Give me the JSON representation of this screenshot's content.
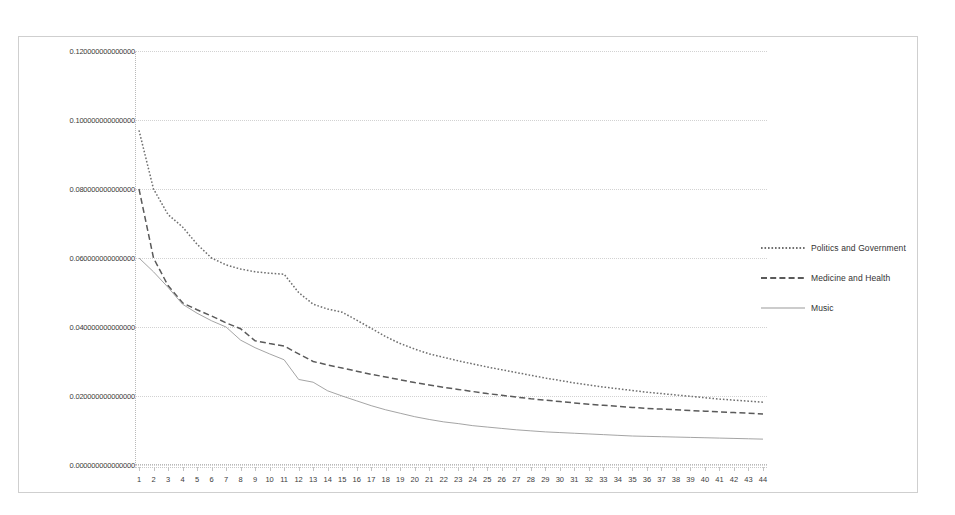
{
  "chart_data": {
    "type": "line",
    "title": "",
    "xlabel": "",
    "ylabel": "",
    "grid": true,
    "legend_position": "right",
    "xlim": [
      1,
      44
    ],
    "ylim": [
      0.0,
      0.12
    ],
    "ytick_labels": [
      "0.120000000000000",
      "0.100000000000000",
      "0.080000000000000",
      "0.060000000000000",
      "0.040000000000000",
      "0.020000000000000",
      "0.000000000000000"
    ],
    "ytick_values": [
      0.12,
      0.1,
      0.08,
      0.06,
      0.04,
      0.02,
      0.0
    ],
    "x": [
      1,
      2,
      3,
      4,
      5,
      6,
      7,
      8,
      9,
      10,
      11,
      12,
      13,
      14,
      15,
      16,
      17,
      18,
      19,
      20,
      21,
      22,
      23,
      24,
      25,
      26,
      27,
      28,
      29,
      30,
      31,
      32,
      33,
      34,
      35,
      36,
      37,
      38,
      39,
      40,
      41,
      42,
      43,
      44
    ],
    "xtick_labels": [
      "1",
      "2",
      "3",
      "4",
      "5",
      "6",
      "7",
      "8",
      "9",
      "10",
      "11",
      "12",
      "13",
      "14",
      "15",
      "16",
      "17",
      "18",
      "19",
      "20",
      "21",
      "22",
      "23",
      "24",
      "25",
      "26",
      "27",
      "28",
      "29",
      "30",
      "31",
      "32",
      "33",
      "34",
      "35",
      "36",
      "37",
      "38",
      "39",
      "40",
      "41",
      "42",
      "43",
      "44"
    ],
    "series": [
      {
        "name": "Politics and Government",
        "style": "dotted",
        "color": "#6f6f6f",
        "values": [
          0.097,
          0.08,
          0.0726,
          0.069,
          0.064,
          0.06,
          0.058,
          0.0568,
          0.056,
          0.0556,
          0.0553,
          0.05,
          0.0466,
          0.0452,
          0.0443,
          0.042,
          0.0396,
          0.0372,
          0.0352,
          0.0336,
          0.0322,
          0.0312,
          0.0302,
          0.0293,
          0.0284,
          0.0276,
          0.0268,
          0.026,
          0.0252,
          0.0245,
          0.0238,
          0.0232,
          0.0226,
          0.0221,
          0.0216,
          0.0211,
          0.0207,
          0.0203,
          0.0199,
          0.0195,
          0.0191,
          0.0188,
          0.0185,
          0.0182
        ]
      },
      {
        "name": "Medicine and Health",
        "style": "dashed",
        "color": "#5a5a5a",
        "values": [
          0.08,
          0.06,
          0.052,
          0.047,
          0.045,
          0.0432,
          0.0412,
          0.0395,
          0.036,
          0.0352,
          0.0345,
          0.0322,
          0.03,
          0.029,
          0.0281,
          0.0272,
          0.0263,
          0.0255,
          0.0247,
          0.0239,
          0.0232,
          0.0225,
          0.0219,
          0.0213,
          0.0207,
          0.0202,
          0.0197,
          0.0192,
          0.0188,
          0.0184,
          0.018,
          0.0176,
          0.0173,
          0.017,
          0.0167,
          0.0164,
          0.0162,
          0.016,
          0.0158,
          0.0156,
          0.0154,
          0.0152,
          0.015,
          0.0148
        ]
      },
      {
        "name": "Music",
        "style": "solid",
        "color": "#9a9a9a",
        "values": [
          0.06,
          0.056,
          0.0515,
          0.0466,
          0.044,
          0.0418,
          0.04,
          0.0362,
          0.034,
          0.0322,
          0.0305,
          0.0248,
          0.024,
          0.0215,
          0.02,
          0.0186,
          0.0172,
          0.016,
          0.015,
          0.014,
          0.0132,
          0.0125,
          0.012,
          0.0114,
          0.011,
          0.0106,
          0.0102,
          0.0099,
          0.0096,
          0.0094,
          0.0092,
          0.009,
          0.0088,
          0.0086,
          0.0084,
          0.0083,
          0.0082,
          0.0081,
          0.008,
          0.0079,
          0.0078,
          0.0077,
          0.0076,
          0.0075
        ]
      }
    ]
  }
}
